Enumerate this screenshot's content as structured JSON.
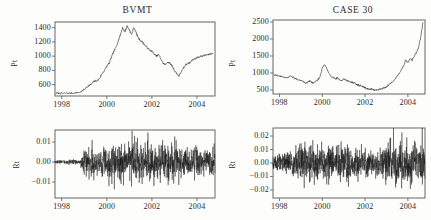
{
  "figure": {
    "background": "#fdfdfc",
    "line_color": "#111111",
    "axis_color": "#555555"
  },
  "panels": {
    "top_left": {
      "title": "BVMT",
      "ylabel": "Pt",
      "yticks": [
        "1400",
        "1200",
        "1000",
        "800",
        "600"
      ],
      "xticks": [
        "1998",
        "2000",
        "2002",
        "2004"
      ]
    },
    "top_right": {
      "title": "CASE 30",
      "ylabel": "Pt",
      "yticks": [
        "2500",
        "2000",
        "1500",
        "1000",
        "500"
      ],
      "xticks": [
        "1998",
        "2000",
        "2002",
        "2004"
      ]
    },
    "bottom_left": {
      "title": "",
      "ylabel": "Rt",
      "yticks": [
        "0.01",
        "0.00",
        "−0.01"
      ],
      "xticks": [
        "1998",
        "2000",
        "2002",
        "2004"
      ]
    },
    "bottom_right": {
      "title": "",
      "ylabel": "Rt",
      "yticks": [
        "0.02",
        "0.01",
        "0.00",
        "−0.01",
        "−0.02"
      ],
      "xticks": [
        "1998",
        "2000",
        "2002",
        "2004"
      ]
    }
  },
  "chart_data": [
    {
      "type": "line",
      "id": "bvmt-price",
      "title": "BVMT",
      "xlabel": "",
      "ylabel": "Pt",
      "xlim": [
        1997.7,
        2004.8
      ],
      "ylim": [
        440,
        1480
      ],
      "xticks": [
        1998,
        2000,
        2002,
        2004
      ],
      "yticks": [
        600,
        800,
        1000,
        1200,
        1400
      ],
      "grid": false,
      "legend": "none",
      "x": [
        1997.75,
        1997.9,
        1998.05,
        1998.2,
        1998.35,
        1998.5,
        1998.65,
        1998.8,
        1998.95,
        1999.1,
        1999.2,
        1999.3,
        1999.4,
        1999.5,
        1999.6,
        1999.7,
        1999.8,
        1999.9,
        2000.0,
        2000.1,
        2000.2,
        2000.3,
        2000.4,
        2000.5,
        2000.6,
        2000.7,
        2000.8,
        2000.9,
        2001.0,
        2001.1,
        2001.2,
        2001.3,
        2001.4,
        2001.5,
        2001.6,
        2001.7,
        2001.8,
        2001.9,
        2002.0,
        2002.1,
        2002.2,
        2002.3,
        2002.4,
        2002.5,
        2002.6,
        2002.7,
        2002.8,
        2002.9,
        2003.0,
        2003.1,
        2003.2,
        2003.3,
        2003.4,
        2003.5,
        2003.6,
        2003.7,
        2003.8,
        2003.9,
        2004.0,
        2004.1,
        2004.2,
        2004.3,
        2004.4,
        2004.5,
        2004.6,
        2004.7
      ],
      "values": [
        480,
        478,
        476,
        480,
        478,
        482,
        486,
        490,
        520,
        560,
        590,
        600,
        640,
        650,
        660,
        700,
        760,
        800,
        860,
        900,
        980,
        1060,
        1120,
        1210,
        1300,
        1400,
        1340,
        1420,
        1370,
        1300,
        1410,
        1330,
        1250,
        1220,
        1190,
        1150,
        1120,
        1080,
        1070,
        1030,
        1000,
        1020,
        960,
        900,
        880,
        920,
        900,
        860,
        800,
        760,
        720,
        780,
        830,
        880,
        900,
        910,
        950,
        960,
        980,
        990,
        1000,
        1010,
        1015,
        1020,
        1030,
        1040
      ]
    },
    {
      "type": "line",
      "id": "case30-price",
      "title": "CASE 30",
      "xlabel": "",
      "ylabel": "Pt",
      "xlim": [
        1997.7,
        2004.8
      ],
      "ylim": [
        380,
        2560
      ],
      "xticks": [
        1998,
        2000,
        2002,
        2004
      ],
      "yticks": [
        500,
        1000,
        1500,
        2000,
        2500
      ],
      "grid": false,
      "legend": "none",
      "x": [
        1997.75,
        1997.9,
        1998.05,
        1998.2,
        1998.35,
        1998.5,
        1998.65,
        1998.8,
        1998.95,
        1999.1,
        1999.2,
        1999.3,
        1999.4,
        1999.5,
        1999.6,
        1999.7,
        1999.8,
        1999.9,
        2000.0,
        2000.1,
        2000.2,
        2000.3,
        2000.4,
        2000.5,
        2000.6,
        2000.7,
        2000.8,
        2000.9,
        2001.0,
        2001.1,
        2001.2,
        2001.3,
        2001.4,
        2001.5,
        2001.6,
        2001.7,
        2001.8,
        2001.9,
        2002.0,
        2002.1,
        2002.2,
        2002.3,
        2002.4,
        2002.5,
        2002.6,
        2002.7,
        2002.8,
        2002.9,
        2003.0,
        2003.1,
        2003.2,
        2003.3,
        2003.4,
        2003.5,
        2003.6,
        2003.7,
        2003.8,
        2003.9,
        2004.0,
        2004.1,
        2004.2,
        2004.3,
        2004.4,
        2004.5,
        2004.6,
        2004.7
      ],
      "values": [
        950,
        930,
        900,
        880,
        860,
        900,
        870,
        820,
        780,
        760,
        700,
        720,
        760,
        740,
        700,
        760,
        800,
        900,
        1150,
        1250,
        1150,
        1000,
        900,
        880,
        820,
        850,
        800,
        780,
        820,
        790,
        760,
        740,
        720,
        700,
        660,
        640,
        620,
        600,
        560,
        540,
        520,
        520,
        500,
        500,
        510,
        520,
        540,
        560,
        600,
        640,
        700,
        760,
        820,
        900,
        1000,
        1100,
        1200,
        1380,
        1300,
        1420,
        1380,
        1500,
        1600,
        1750,
        2050,
        2480
      ]
    },
    {
      "type": "line",
      "id": "bvmt-returns",
      "title": "",
      "xlabel": "",
      "ylabel": "Rt",
      "xlim": [
        1997.7,
        2004.8
      ],
      "ylim": [
        -0.018,
        0.016
      ],
      "xticks": [
        1998,
        2000,
        2002,
        2004
      ],
      "yticks": [
        -0.01,
        0.0,
        0.01
      ],
      "grid": false,
      "legend": "none",
      "description": "Daily log returns of BVMT index; near-zero volatility before 1999, then volatility clustering roughly within +/-0.012 with occasional spikes to -0.016",
      "volatility_profile": [
        {
          "x": 1997.75,
          "sigma": 0.0004
        },
        {
          "x": 1998.8,
          "sigma": 0.0006
        },
        {
          "x": 1999.1,
          "sigma": 0.0045
        },
        {
          "x": 1999.6,
          "sigma": 0.0035
        },
        {
          "x": 2000.4,
          "sigma": 0.0042
        },
        {
          "x": 2001.0,
          "sigma": 0.005
        },
        {
          "x": 2001.6,
          "sigma": 0.0045
        },
        {
          "x": 2002.3,
          "sigma": 0.0048
        },
        {
          "x": 2002.9,
          "sigma": 0.0052
        },
        {
          "x": 2003.5,
          "sigma": 0.004
        },
        {
          "x": 2004.2,
          "sigma": 0.0033
        },
        {
          "x": 2004.7,
          "sigma": 0.003
        }
      ]
    },
    {
      "type": "line",
      "id": "case30-returns",
      "title": "",
      "xlabel": "",
      "ylabel": "Rt",
      "xlim": [
        1997.7,
        2004.8
      ],
      "ylim": [
        -0.026,
        0.026
      ],
      "xticks": [
        1998,
        2000,
        2002,
        2004
      ],
      "yticks": [
        -0.02,
        -0.01,
        0.0,
        0.01,
        0.02
      ],
      "grid": false,
      "legend": "none",
      "description": "Daily log returns of CASE 30 index; persistent volatility clustering mostly within +/-0.015 with spikes approaching +/-0.024",
      "volatility_profile": [
        {
          "x": 1997.75,
          "sigma": 0.0035
        },
        {
          "x": 1998.4,
          "sigma": 0.004
        },
        {
          "x": 1999.0,
          "sigma": 0.0075
        },
        {
          "x": 1999.6,
          "sigma": 0.007
        },
        {
          "x": 2000.3,
          "sigma": 0.0065
        },
        {
          "x": 2001.0,
          "sigma": 0.006
        },
        {
          "x": 2001.7,
          "sigma": 0.0055
        },
        {
          "x": 2002.3,
          "sigma": 0.0045
        },
        {
          "x": 2002.9,
          "sigma": 0.006
        },
        {
          "x": 2003.4,
          "sigma": 0.0085
        },
        {
          "x": 2004.0,
          "sigma": 0.008
        },
        {
          "x": 2004.7,
          "sigma": 0.0085
        }
      ]
    }
  ]
}
